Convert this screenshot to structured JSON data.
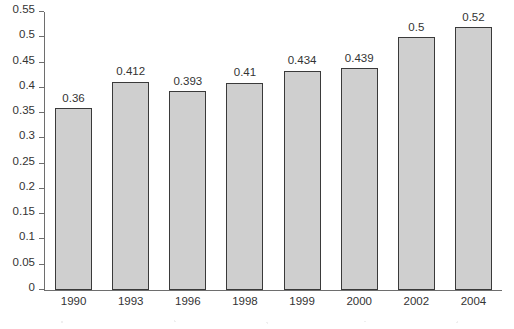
{
  "chart_data": {
    "type": "bar",
    "title": "",
    "xlabel": "",
    "ylabel": "",
    "categories": [
      "1990",
      "1993",
      "1996",
      "1998",
      "1999",
      "2000",
      "2002",
      "2004"
    ],
    "values": [
      0.36,
      0.412,
      0.393,
      0.41,
      0.434,
      0.439,
      0.5,
      0.52
    ],
    "value_labels": [
      "0.36",
      "0.412",
      "0.393",
      "0.41",
      "0.434",
      "0.439",
      "0.5",
      "0.52"
    ],
    "ylim": [
      0,
      0.55
    ],
    "yticks": [
      0,
      0.05,
      0.1,
      0.15,
      0.2,
      0.25,
      0.3,
      0.35,
      0.4,
      0.45,
      0.5,
      0.55
    ],
    "ytick_labels": [
      "0",
      "0.05",
      "0.1",
      "0.15",
      "0.2",
      "0.25",
      "0.3",
      "0.35",
      "0.4",
      "0.45",
      "0.5",
      "0.55"
    ],
    "grid": false,
    "legend": null,
    "legend_position": "none",
    "bar_fill_color": "#cfcfcf",
    "bar_border_color": "#3a3a3a",
    "axis_color": "#6e6e6e",
    "background_color": "#ffffff",
    "text_color": "#333333"
  }
}
